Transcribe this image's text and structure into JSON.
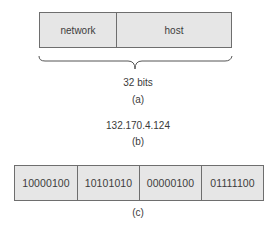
{
  "part_a": {
    "fields": [
      {
        "label": "network"
      },
      {
        "label": "host"
      }
    ],
    "brace_label": "32 bits",
    "caption": "(a)"
  },
  "part_b": {
    "address": "132.170.4.124",
    "caption": "(b)"
  },
  "part_c": {
    "octets": [
      "10000100",
      "10101010",
      "00000100",
      "01111100"
    ],
    "caption": "(c)"
  },
  "colors": {
    "box_fill": "#e6e6e6",
    "box_border": "#6e6e6e",
    "text": "#3a3a3a"
  }
}
